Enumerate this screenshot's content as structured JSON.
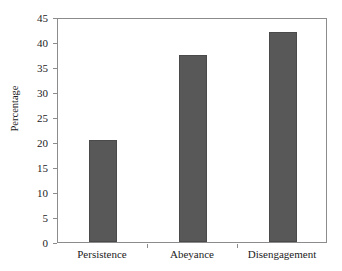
{
  "chart_data": {
    "type": "bar",
    "title": "",
    "subtitle": "",
    "xlabel": "",
    "ylabel": "Percentage",
    "categories": [
      "Persistence",
      "Abeyance",
      "Disengagement"
    ],
    "values": [
      20.4,
      37.4,
      42.0
    ],
    "series": [
      {
        "name": "Percentage",
        "values": [
          20.4,
          37.4,
          42.0
        ]
      }
    ],
    "ylim": [
      0,
      45
    ],
    "yticks": [
      0,
      5,
      10,
      15,
      20,
      25,
      30,
      35,
      40,
      45
    ],
    "ytick_labels": [
      "0",
      "5",
      "10",
      "15",
      "20",
      "25",
      "30",
      "35",
      "40",
      "45"
    ],
    "grid": false,
    "legend": false,
    "legend_position": "none",
    "bar_color": "#585858",
    "bar_edge_color": "#4a4a4a",
    "axis_color": "#8c8c8c",
    "text_color": "#1c1c1c",
    "background_color": "#ffffff"
  }
}
